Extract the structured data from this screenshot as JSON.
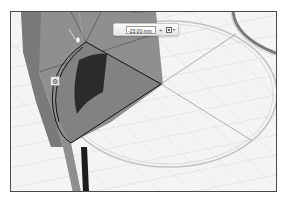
{
  "viewport": {
    "background": "#f4f4f4",
    "grid_color": "#dcdcdc",
    "body_color": "#8e8e8e",
    "dark_face_color": "#2a2a2a",
    "sketch_line_color": "#111111",
    "ring_color": "#bdbdbd"
  },
  "dimension_input": {
    "value": "-23.00 mm",
    "stepper_glyph": "+",
    "options_caret": "▾"
  },
  "gear_button": {
    "glyph": "⚙"
  }
}
